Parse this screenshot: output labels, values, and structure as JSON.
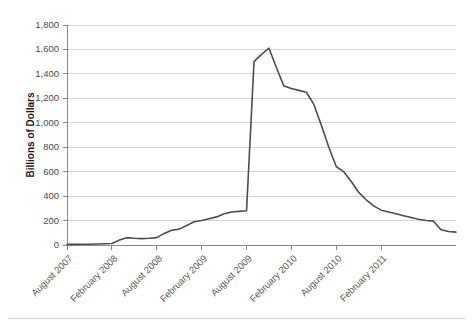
{
  "chart_data": {
    "type": "line",
    "title": "",
    "xlabel": "",
    "ylabel": "Billions of Dollars",
    "ylim": [
      0,
      1800
    ],
    "ytick_step": 200,
    "ytick_labels": [
      "0",
      "200",
      "400",
      "600",
      "800",
      "1,000",
      "1,200",
      "1,400",
      "1,600",
      "1,800"
    ],
    "ytick_values": [
      0,
      200,
      400,
      600,
      800,
      1000,
      1200,
      1400,
      1600,
      1800
    ],
    "xtick_labels": [
      "August 2007",
      "February 2008",
      "August 2008",
      "February 2009",
      "August 2009",
      "February 2010",
      "August 2010",
      "February 2011"
    ],
    "xtick_indices": [
      0,
      6,
      12,
      18,
      24,
      30,
      36,
      42
    ],
    "grid": true,
    "legend": null,
    "line_color": "#4d4d4d",
    "grid_color": "#c9c9c9",
    "axis_color": "#8a8a8a",
    "x_count": 46,
    "values": [
      5,
      5,
      6,
      6,
      8,
      10,
      12,
      40,
      60,
      55,
      52,
      55,
      60,
      95,
      120,
      130,
      160,
      190,
      200,
      215,
      230,
      255,
      270,
      275,
      280,
      1500,
      1560,
      1610,
      1450,
      1300,
      1280,
      1265,
      1250,
      1150,
      980,
      800,
      640,
      600,
      520,
      430,
      370,
      320,
      285,
      270,
      255,
      240
    ],
    "tail_values": [
      225,
      210,
      200,
      195,
      125,
      110,
      105
    ]
  }
}
